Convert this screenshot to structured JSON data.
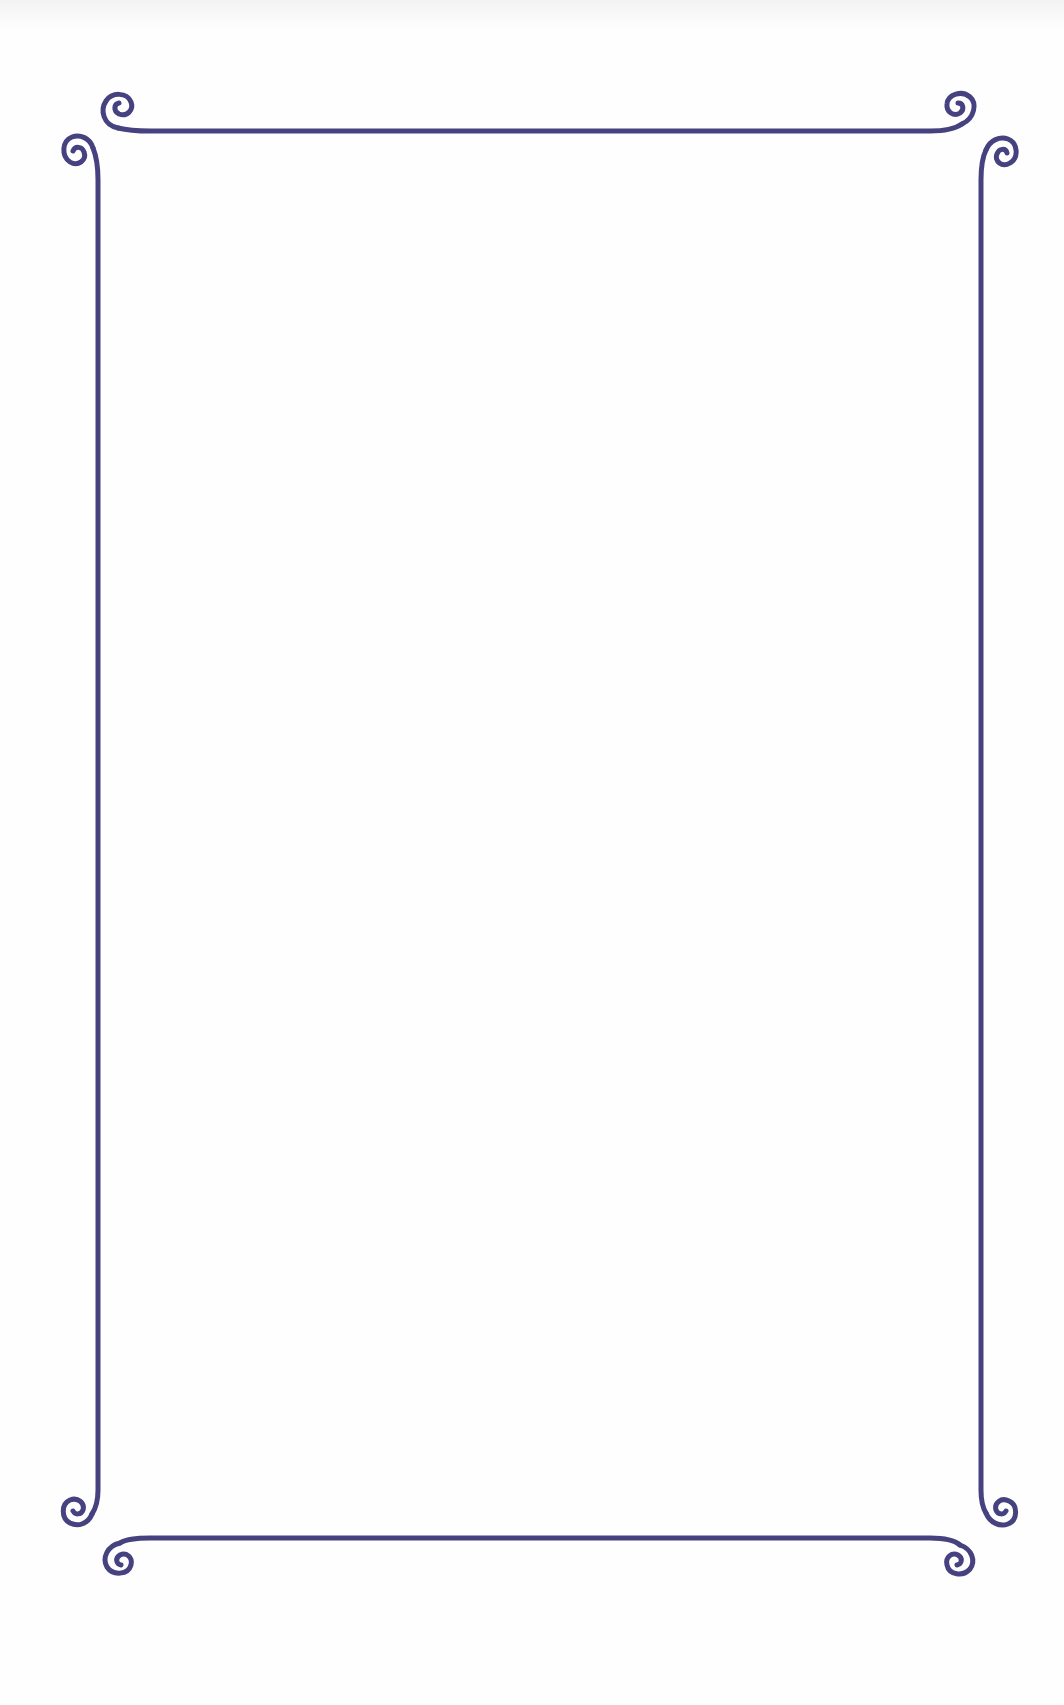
{
  "page": {
    "background": "#fefefe",
    "content_text": ""
  },
  "frame": {
    "style": "ornamental scroll border",
    "stroke_color": "#45427f",
    "stroke_width": 5,
    "top_rule": {
      "y": 130,
      "x1": 122,
      "x2": 946
    },
    "bottom_rule": {
      "y": 1538,
      "x1": 122,
      "x2": 946
    },
    "left_rule": {
      "x": 98,
      "y1": 150,
      "y2": 1505
    },
    "right_rule": {
      "x": 982,
      "y1": 150,
      "y2": 1505
    },
    "corner_scrolls": [
      {
        "name": "top-left-horizontal",
        "cx": 118,
        "cy": 107
      },
      {
        "name": "top-left-vertical",
        "cx": 74,
        "cy": 152
      },
      {
        "name": "top-right-horizontal",
        "cx": 960,
        "cy": 109
      },
      {
        "name": "top-right-vertical",
        "cx": 1003,
        "cy": 153
      },
      {
        "name": "bottom-left-vertical",
        "cx": 76,
        "cy": 1512
      },
      {
        "name": "bottom-left-horizontal",
        "cx": 119,
        "cy": 1560
      },
      {
        "name": "bottom-right-vertical",
        "cx": 1001,
        "cy": 1515
      },
      {
        "name": "bottom-right-horizontal",
        "cx": 960,
        "cy": 1561
      }
    ]
  }
}
